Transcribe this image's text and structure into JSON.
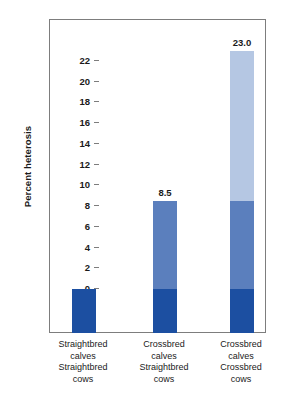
{
  "chart_data": {
    "type": "bar",
    "title": "",
    "subtitle": "",
    "xlabel": "",
    "ylabel": "Percent heterosis",
    "ylim": [
      -4.5,
      24
    ],
    "yticks": [
      0,
      2,
      4,
      6,
      8,
      10,
      12,
      14,
      16,
      18,
      20,
      22
    ],
    "ytick_labels": [
      "0",
      "2",
      "4",
      "6",
      "8",
      "10",
      "12",
      "14",
      "16",
      "18",
      "20",
      "22"
    ],
    "grid": false,
    "legend": null,
    "stacked": true,
    "categories": [
      "Straightbred calves Straightbred cows",
      "Crossbred calves Straightbred cows",
      "Crossbred calves Crossbred cows"
    ],
    "category_lines": [
      [
        "Straightbred",
        "calves",
        "Straightbred",
        "cows"
      ],
      [
        "Crossbred",
        "calves",
        "Straightbred",
        "cows"
      ],
      [
        "Crossbred",
        "calves",
        "Crossbred",
        "cows"
      ]
    ],
    "values": [
      0.0,
      8.5,
      23.0
    ],
    "data_labels": [
      "",
      "8.5",
      "23.0"
    ],
    "series": [
      {
        "name": "individual-heterosis",
        "values": [
          0.0,
          8.5,
          8.5
        ],
        "color": "#5b7fbd"
      },
      {
        "name": "maternal-heterosis",
        "values": [
          0.0,
          0.0,
          14.5
        ],
        "color": "#b5c7e3"
      }
    ],
    "baseline_block": {
      "name": "baseline-reference",
      "color": "#1c4fa1",
      "extends_below_zero": true
    },
    "colors": {
      "dark_blue": "#1c4fa1",
      "medium_blue": "#5b7fbd",
      "light_blue": "#b5c7e3",
      "axis": "#7d7d7d",
      "text": "#1a1a1a",
      "background": "#ffffff"
    }
  },
  "axis": {
    "y_title": "Percent heterosis"
  }
}
